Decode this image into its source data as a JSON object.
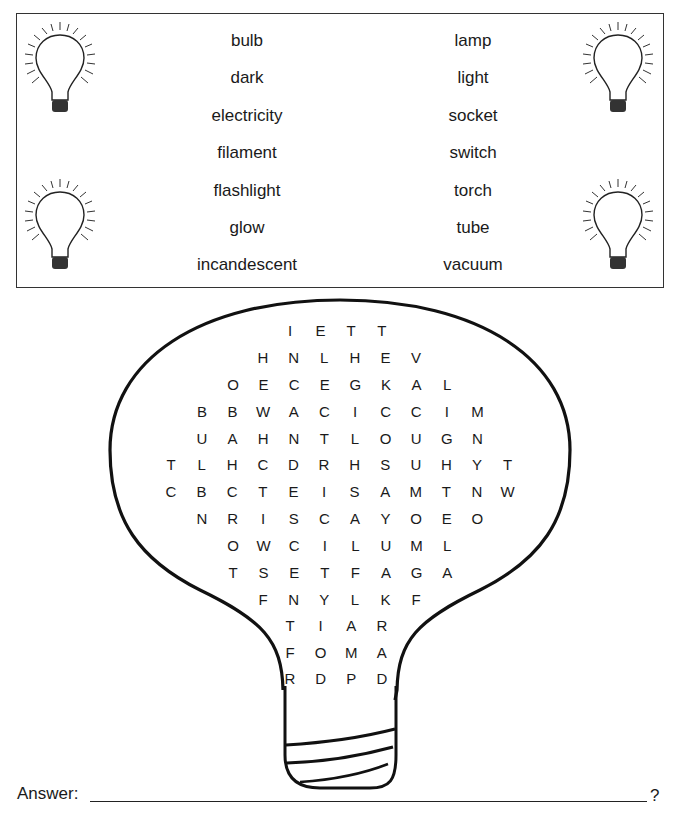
{
  "word_list": {
    "left": [
      "bulb",
      "dark",
      "electricity",
      "filament",
      "flashlight",
      "glow",
      "incandescent"
    ],
    "right": [
      "lamp",
      "light",
      "socket",
      "switch",
      "torch",
      "tube",
      "vacuum"
    ]
  },
  "decorations": [
    "lightbulb-icon",
    "lightbulb-icon",
    "lightbulb-icon",
    "lightbulb-icon"
  ],
  "puzzle": {
    "rows": [
      {
        "y": 330,
        "x0": 290,
        "letters": "IETT"
      },
      {
        "y": 357,
        "x0": 263,
        "letters": "HNLHEV"
      },
      {
        "y": 384,
        "x0": 233,
        "letters": "OECEGKAL"
      },
      {
        "y": 411,
        "x0": 202,
        "letters": "BBWACICCIM"
      },
      {
        "y": 438,
        "x0": 202,
        "letters": "UAHNTLOUGN"
      },
      {
        "y": 464,
        "x0": 171,
        "letters": "TLHCDRHSUHYT"
      },
      {
        "y": 491,
        "x0": 171,
        "letters": "CBCTEISAMTNW"
      },
      {
        "y": 518,
        "x0": 202,
        "letters": "NRISCAYOEO"
      },
      {
        "y": 545,
        "x0": 233,
        "letters": "OWCILUML"
      },
      {
        "y": 572,
        "x0": 233,
        "letters": "TSETFAGA"
      },
      {
        "y": 599,
        "x0": 263,
        "letters": "FNYLKF"
      },
      {
        "y": 625,
        "x0": 290,
        "letters": "TIAR"
      },
      {
        "y": 652,
        "x0": 290,
        "letters": "FOMA"
      },
      {
        "y": 678,
        "x0": 290,
        "letters": "RDPD"
      }
    ],
    "spacing": 30.6
  },
  "answer": {
    "label": "Answer:",
    "value": "",
    "suffix": "?"
  }
}
